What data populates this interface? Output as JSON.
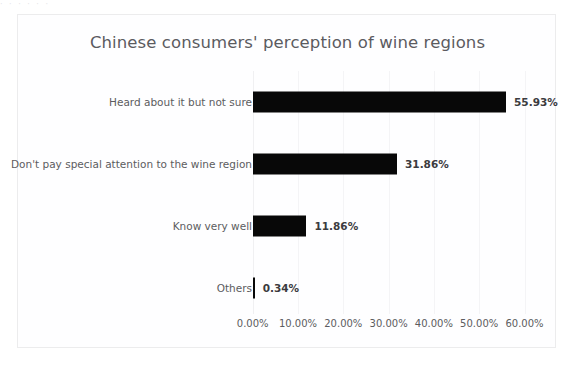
{
  "artifact": {
    "top_fragment": "·  ·          ·   ·     ·      ·"
  },
  "chart_data": {
    "type": "bar",
    "orientation": "horizontal",
    "title": "Chinese consumers' perception of wine regions",
    "xlabel": "",
    "ylabel": "",
    "categories": [
      "Heard about it but not sure",
      "Don't pay special attention to the wine region",
      "Know very well",
      "Others"
    ],
    "values": [
      55.93,
      31.86,
      11.86,
      0.34
    ],
    "data_labels": [
      "55.93%",
      "31.86%",
      "11.86%",
      "0.34%"
    ],
    "xlim": [
      0,
      60
    ],
    "xticks": [
      0,
      10,
      20,
      30,
      40,
      50,
      60
    ],
    "xtick_labels": [
      "0.00%",
      "10.00%",
      "20.00%",
      "30.00%",
      "40.00%",
      "50.00%",
      "60.00%"
    ],
    "grid": true,
    "grid_axis": "x",
    "legend": false,
    "bar_color": "#080808",
    "title_color": "#5b5b5f",
    "label_color": "#5c5c60",
    "value_color": "#3b3b3e",
    "background": "#fefeff",
    "border_color": "#ececed",
    "gridline_color": "#f4f4f6"
  }
}
